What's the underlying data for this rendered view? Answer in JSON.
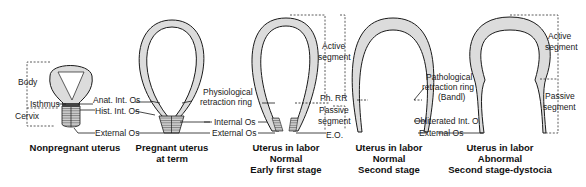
{
  "figures": [
    {
      "id": "nonpregnant",
      "caption": [
        "Nonpregnant uterus"
      ],
      "labels": {
        "body": "Body",
        "isthmus": "Isthmus",
        "cervix": "Cervix",
        "anat_int_os": "Anat. Int. Os",
        "hist_int_os": "Hist. Int. Os",
        "external_os": "External Os"
      }
    },
    {
      "id": "pregnant-term",
      "caption": [
        "Pregnant uterus",
        "at term"
      ],
      "labels": {
        "physiological_ring_1": "Physiological",
        "physiological_ring_2": "retraction ring",
        "internal_os": "Internal Os",
        "external_os": "External Os"
      }
    },
    {
      "id": "labor-early-first",
      "caption": [
        "Uterus in labor",
        "Normal",
        "Early first stage"
      ],
      "labels": {
        "active_1": "Active",
        "active_2": "segment",
        "ph_rr": "Ph. RR",
        "passive_1": "Passive",
        "passive_2": "segment",
        "eo": "E.O."
      }
    },
    {
      "id": "labor-second-stage",
      "caption": [
        "Uterus in labor",
        "Normal",
        "Second stage"
      ],
      "labels": {
        "pathological_1": "Pathological",
        "pathological_2": "retraction ring",
        "pathological_3": "(Bandl)",
        "obliterated": "Obliterated  Int.  Os",
        "external_os": "External Os"
      }
    },
    {
      "id": "labor-dystocia",
      "caption": [
        "Uterus in labor",
        "Abnormal",
        "Second stage-dystocia"
      ],
      "labels": {
        "active_1": "Active",
        "active_2": "segment",
        "passive_1": "Passive",
        "passive_2": "segment"
      }
    }
  ]
}
